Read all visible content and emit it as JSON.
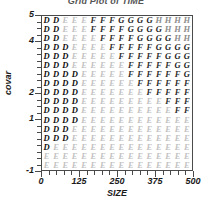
{
  "chart_data": {
    "type": "heatmap",
    "title": "Grid Plot of TIME",
    "xlabel": "SIZE",
    "ylabel": "covar",
    "grid": true,
    "legend": "none",
    "xlim": [
      0,
      500
    ],
    "ylim": [
      -1,
      5
    ],
    "x_ticks": [
      "0",
      "125",
      "250",
      "375",
      "500"
    ],
    "x_tick_values": [
      0,
      125,
      250,
      375,
      500
    ],
    "x_minor_count": 4,
    "y_ticks": [
      "5",
      "4",
      "2",
      "1",
      "-1"
    ],
    "y_tick_values": [
      5,
      4,
      2,
      1,
      -1
    ],
    "y_minor_count": 4,
    "level_letters": [
      "D",
      "E",
      "F",
      "G",
      "H"
    ],
    "level_colors": {
      "D": "#0d0d0d",
      "E": "#c2c2c2",
      "F": "#2e2e2e",
      "G": "#1a1a1a",
      "H": "#8d8d8d"
    },
    "n_rows": 17,
    "n_cols": 16,
    "rows": [
      [
        "D",
        "D",
        "E",
        "E",
        "E",
        "F",
        "F",
        "F",
        "G",
        "G",
        "G",
        "G",
        "H",
        "H",
        "H",
        "H"
      ],
      [
        "D",
        "D",
        "E",
        "E",
        "E",
        "F",
        "F",
        "F",
        "F",
        "G",
        "G",
        "G",
        "G",
        "H",
        "H",
        "H"
      ],
      [
        "D",
        "D",
        "E",
        "E",
        "E",
        "E",
        "F",
        "F",
        "F",
        "F",
        "G",
        "G",
        "G",
        "G",
        "H",
        "H"
      ],
      [
        "D",
        "D",
        "D",
        "E",
        "E",
        "E",
        "E",
        "F",
        "F",
        "F",
        "F",
        "F",
        "G",
        "G",
        "G",
        "G"
      ],
      [
        "D",
        "D",
        "D",
        "E",
        "E",
        "E",
        "E",
        "E",
        "F",
        "F",
        "F",
        "F",
        "F",
        "G",
        "G",
        "G"
      ],
      [
        "D",
        "D",
        "D",
        "E",
        "E",
        "E",
        "E",
        "E",
        "E",
        "F",
        "F",
        "F",
        "F",
        "F",
        "G",
        "G"
      ],
      [
        "D",
        "D",
        "D",
        "D",
        "E",
        "E",
        "E",
        "E",
        "E",
        "F",
        "F",
        "F",
        "F",
        "F",
        "F",
        "G"
      ],
      [
        "D",
        "D",
        "D",
        "D",
        "E",
        "E",
        "E",
        "E",
        "E",
        "E",
        "F",
        "F",
        "F",
        "F",
        "F",
        "F"
      ],
      [
        "D",
        "D",
        "D",
        "D",
        "E",
        "E",
        "E",
        "E",
        "E",
        "E",
        "E",
        "F",
        "F",
        "F",
        "F",
        "F"
      ],
      [
        "D",
        "D",
        "D",
        "D",
        "E",
        "E",
        "E",
        "E",
        "E",
        "E",
        "E",
        "E",
        "E",
        "F",
        "F",
        "F"
      ],
      [
        "D",
        "D",
        "D",
        "D",
        "E",
        "E",
        "E",
        "E",
        "E",
        "E",
        "E",
        "E",
        "E",
        "E",
        "F",
        "F"
      ],
      [
        "D",
        "D",
        "D",
        "D",
        "E",
        "E",
        "E",
        "E",
        "E",
        "E",
        "E",
        "E",
        "E",
        "E",
        "E",
        "E"
      ],
      [
        "D",
        "D",
        "D",
        "E",
        "E",
        "E",
        "E",
        "E",
        "E",
        "E",
        "E",
        "E",
        "E",
        "E",
        "E",
        "E"
      ],
      [
        "D",
        "D",
        "D",
        "E",
        "E",
        "E",
        "E",
        "E",
        "E",
        "E",
        "E",
        "E",
        "E",
        "E",
        "E",
        "E"
      ],
      [
        "D",
        "E",
        "E",
        "E",
        "E",
        "E",
        "E",
        "E",
        "E",
        "E",
        "E",
        "E",
        "E",
        "E",
        "E",
        "E"
      ],
      [
        "E",
        "E",
        "E",
        "E",
        "E",
        "E",
        "E",
        "E",
        "E",
        "E",
        "E",
        "E",
        "E",
        "E",
        "E",
        "E"
      ],
      [
        "E",
        "E",
        "E",
        "E",
        "E",
        "E",
        "E",
        "E",
        "E",
        "E",
        "E",
        "E",
        "E",
        "E",
        "E",
        "E"
      ]
    ]
  }
}
